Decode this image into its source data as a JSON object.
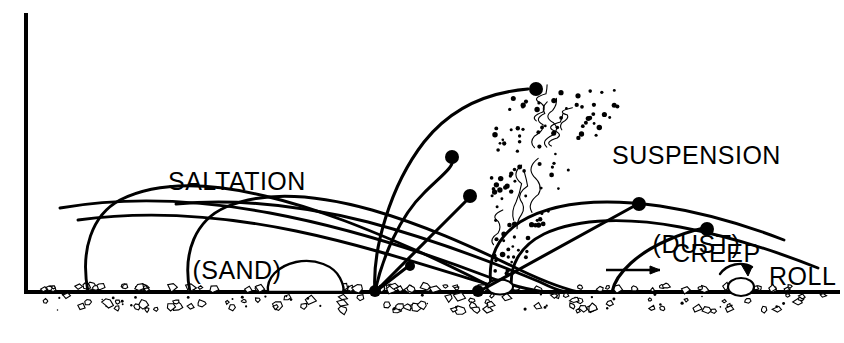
{
  "figure": {
    "kind": "aeolian-sediment-transport-diagram",
    "background_color": "#ffffff",
    "ink_color": "#000000",
    "width": 844,
    "height": 343
  },
  "labels": {
    "saltation": {
      "main": "SALTATION",
      "sub": "(SAND)"
    },
    "suspension": {
      "main": "SUSPENSION",
      "sub": "(DUST)"
    },
    "creep": "CREEP",
    "roll": "ROLL"
  },
  "axis": {
    "vertical_x": 26,
    "vertical_top": 15,
    "ground_y": 292,
    "ground_x_start": 26,
    "ground_x_end": 838,
    "stroke_width": 4
  },
  "ground": {
    "name": "sand-bed-surface",
    "grain_count": 150,
    "grain_color": "#ffffff",
    "grain_outline": "#000000"
  },
  "saltation_paths": [
    {
      "name": "saltation-arc-1",
      "d": "M 88 292 C 80 250 92 215 120 200 C 160 180 215 184 265 196 C 320 209 372 231 420 252 C 455 268 480 281 500 291"
    },
    {
      "name": "saltation-arc-2",
      "d": "M 190 292 C 182 252 196 220 226 207 C 268 189 322 196 372 210 C 424 225 470 246 512 266 C 540 280 562 288 578 292"
    },
    {
      "name": "saltation-arc-3",
      "d": "M 60 208 C 130 196 200 200 270 213 C 345 227 420 251 486 276 C 512 286 530 290 545 292"
    },
    {
      "name": "saltation-arc-4",
      "d": "M 78 220 C 150 210 224 216 296 231 C 368 246 440 270 500 288 C 512 291 520 292 528 292"
    },
    {
      "name": "saltation-arc-5",
      "d": "M 176 204 C 240 198 304 206 368 222 C 432 239 492 262 540 282 C 552 288 560 291 566 292"
    },
    {
      "name": "saltation-arc-6",
      "d": "M 492 292 C 486 262 496 238 520 222 C 556 200 610 199 660 206 C 706 213 748 226 784 240"
    },
    {
      "name": "saltation-arc-7",
      "d": "M 512 292 C 508 266 520 246 544 234 C 580 217 632 218 680 227 C 728 236 778 252 818 268"
    }
  ],
  "ejection_paths": [
    {
      "name": "ejection-trajectory-1",
      "d": "M 375 292 C 372 250 390 186 424 142 C 454 104 492 92 528 89",
      "dot": {
        "cx": 536,
        "cy": 89,
        "r": 7
      }
    },
    {
      "name": "ejection-trajectory-2",
      "d": "M 375 292 C 382 258 400 216 424 193 C 440 177 455 166 452 160",
      "dot": {
        "cx": 452,
        "cy": 157,
        "r": 7
      }
    },
    {
      "name": "ejection-trajectory-3",
      "d": "M 375 292 L 468 199",
      "dot": {
        "cx": 470,
        "cy": 196,
        "r": 7
      }
    },
    {
      "name": "ejection-trajectory-4",
      "d": "M 375 292 L 406 268",
      "dot": {
        "cx": 410,
        "cy": 266,
        "r": 5
      }
    },
    {
      "name": "ejection-trajectory-5",
      "d": "M 478 292 L 636 205",
      "dot": {
        "cx": 639,
        "cy": 204,
        "r": 7
      }
    },
    {
      "name": "ejection-trajectory-6",
      "d": "M 612 292 C 616 272 640 252 668 240 C 686 232 700 229 704 228",
      "dot": {
        "cx": 707,
        "cy": 229,
        "r": 7
      }
    }
  ],
  "impact_points": [
    {
      "name": "impact-point-1",
      "cx": 375,
      "cy": 291,
      "r": 6
    },
    {
      "name": "impact-point-2",
      "cx": 478,
      "cy": 291,
      "r": 6
    }
  ],
  "boulder": {
    "name": "large-pebble",
    "d": "M 268 292 C 266 278 278 266 296 262 C 316 258 334 266 340 278 C 344 286 344 290 343 292 Z"
  },
  "creep_arrow": {
    "name": "creep-arrow",
    "line": "M 606 270 L 660 270",
    "head": "M 660 270 L 650 266 L 650 274 Z"
  },
  "roll": {
    "name": "roll-grain",
    "grain": {
      "cx": 741,
      "cy": 287,
      "rx": 13,
      "ry": 9
    },
    "arrow": "M 720 274 C 727 264 742 261 752 267",
    "head": "M 752 267 L 741 264 L 748 276 Z"
  },
  "dust_plume": {
    "name": "suspension-dust-plume",
    "origin_x": 500,
    "origin_y": 290,
    "top_y": 92,
    "dot_count": 110,
    "squiggle_count": 9
  }
}
